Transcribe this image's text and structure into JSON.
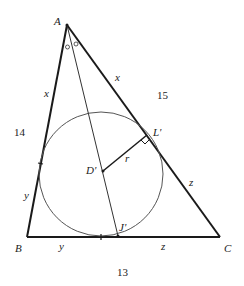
{
  "diagram": {
    "type": "geometry-triangle-incircle",
    "colors": {
      "stroke": "#1a1a1a",
      "thin": "#444444",
      "text": "#222222"
    },
    "vertices": {
      "A": {
        "label": "A",
        "x": 67,
        "y": 25
      },
      "B": {
        "label": "B",
        "x": 27,
        "y": 237
      },
      "C": {
        "label": "C",
        "x": 220,
        "y": 237
      }
    },
    "incircle": {
      "center_label": "D'",
      "cx": 101,
      "cy": 174,
      "r": 62
    },
    "points": {
      "L": {
        "label": "L'",
        "x": 147,
        "y": 135
      },
      "J": {
        "label": "J'",
        "x": 118,
        "y": 236
      },
      "D": {
        "label": "D'",
        "x": 103,
        "y": 171
      }
    },
    "side_lengths": {
      "AB": "14",
      "AC": "15",
      "BC": "13"
    },
    "segment_labels": {
      "AB_upper": "x",
      "AB_lower": "y",
      "AC_upper": "x",
      "AC_lower": "z",
      "BC_left": "y",
      "BC_right": "z",
      "radius": "r"
    },
    "angle_marks": "o o"
  }
}
